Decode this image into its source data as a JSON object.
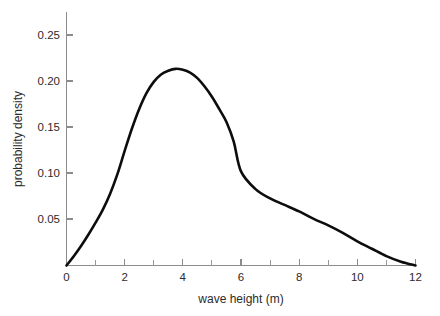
{
  "chart_data": {
    "type": "line",
    "title": "",
    "subtitle": "",
    "xlabel": "wave height (m)",
    "ylabel": "probability density",
    "xlim": [
      0,
      12
    ],
    "ylim": [
      0,
      0.272
    ],
    "grid": false,
    "legend": null,
    "legend_position": "none",
    "x_ticks": [
      0,
      2,
      4,
      6,
      8,
      10,
      12
    ],
    "x_tick_labels": [
      "0",
      "2",
      "4",
      "6",
      "8",
      "10",
      "12"
    ],
    "x_minor_ticks": [
      1,
      3,
      5,
      7,
      9,
      11
    ],
    "y_ticks": [
      0.05,
      0.1,
      0.15,
      0.2,
      0.25
    ],
    "y_tick_labels": [
      "0.05",
      "0.10",
      "0.15",
      "0.20",
      "0.25"
    ],
    "series": [
      {
        "name": "wave height distribution",
        "color": "#0d0d0d",
        "x": [
          0.0,
          0.25,
          0.5,
          0.75,
          1.0,
          1.25,
          1.5,
          1.75,
          2.0,
          2.25,
          2.5,
          2.75,
          3.0,
          3.25,
          3.5,
          3.75,
          4.0,
          4.25,
          4.5,
          4.75,
          5.0,
          5.25,
          5.5,
          5.75,
          6.0,
          6.5,
          7.0,
          7.5,
          8.0,
          8.5,
          9.0,
          9.5,
          10.0,
          10.5,
          11.0,
          11.5,
          12.0
        ],
        "y": [
          0.0,
          0.01,
          0.021,
          0.033,
          0.046,
          0.06,
          0.077,
          0.098,
          0.123,
          0.147,
          0.168,
          0.185,
          0.197,
          0.205,
          0.209,
          0.211,
          0.21,
          0.207,
          0.201,
          0.192,
          0.181,
          0.168,
          0.154,
          0.133,
          0.101,
          0.082,
          0.072,
          0.065,
          0.058,
          0.05,
          0.043,
          0.035,
          0.026,
          0.018,
          0.01,
          0.004,
          0.0
        ]
      }
    ],
    "annotations": [],
    "peak": {
      "x": 3.9,
      "y": 0.211
    },
    "axis_color": "#8c8c8c",
    "background_color": "#ffffff"
  },
  "figure": {
    "x_axis_title": "wave height (m)",
    "y_axis_title": "probability density"
  }
}
